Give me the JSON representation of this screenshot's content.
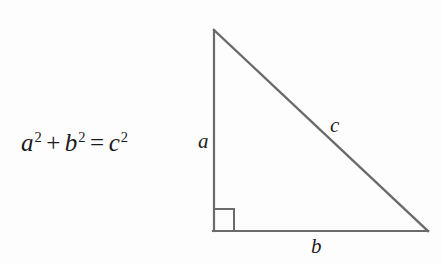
{
  "figure": {
    "name": "pythagorean-theorem-diagram",
    "background_color": "#fdfdfd",
    "line_color": "#6a6a6a",
    "text_color": "#1a1a1a"
  },
  "equation": {
    "full_text": "a² + b² = c²",
    "term1_base": "a",
    "term1_exponent": "2",
    "operator_plus": "+",
    "term2_base": "b",
    "term2_exponent": "2",
    "operator_equals": "=",
    "term3_base": "c",
    "term3_exponent": "2"
  },
  "triangle": {
    "type": "right-triangle",
    "vertices": {
      "apex": [
        214,
        30
      ],
      "right_angle": [
        214,
        231
      ],
      "bottom_right": [
        428,
        231
      ]
    },
    "labels": {
      "vertical_leg": "a",
      "horizontal_leg": "b",
      "hypotenuse": "c"
    },
    "right_angle_marker": {
      "present": true,
      "size": 21
    }
  }
}
